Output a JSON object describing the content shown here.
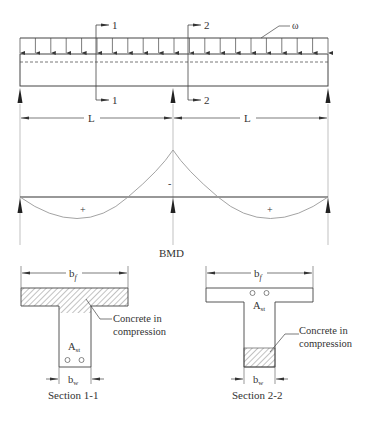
{
  "beam": {
    "load_label": "ω",
    "section_1_label": "1",
    "section_2_label": "2",
    "span_label_left": "L",
    "span_label_right": "L"
  },
  "bmd": {
    "title": "BMD",
    "hogging_sign": "-",
    "sagging_sign_left": "+",
    "sagging_sign_right": "+"
  },
  "section_1": {
    "flange_width_label": "b",
    "flange_width_sub": "f",
    "steel_label": "A",
    "steel_sub": "st",
    "web_width_label": "b",
    "web_width_sub": "w",
    "compression_line1": "Concrete in",
    "compression_line2": "compression",
    "caption": "Section 1-1"
  },
  "section_2": {
    "flange_width_label": "b",
    "flange_width_sub": "f",
    "steel_label": "A",
    "steel_sub": "st",
    "web_width_label": "b",
    "web_width_sub": "w",
    "compression_line1": "Concrete in",
    "compression_line2": "compression",
    "caption": "Section 2-2"
  }
}
